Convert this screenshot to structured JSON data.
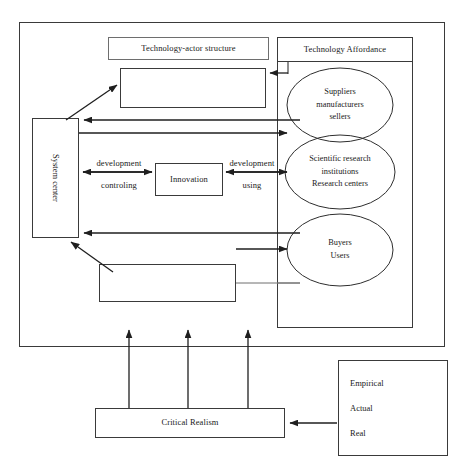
{
  "figure": {
    "type": "diagram",
    "title": ""
  },
  "outer_frame": {
    "name": "main-framework-border"
  },
  "nodes": {
    "technology_actor_structure_label": "Technology-actor structure",
    "technology_actor_structure_body": "",
    "technology_affordance_label": "Technology Affordance",
    "system_center": "System center",
    "innovation": "Innovation",
    "lower_structure_body": "",
    "critical_realism": "Critical Realism"
  },
  "affordance_groups": [
    {
      "id": "suppliers",
      "lines": [
        "Suppliers",
        "manufacturers",
        "sellers"
      ]
    },
    {
      "id": "research",
      "lines": [
        "Scientific research",
        "institutions",
        "Research centers"
      ]
    },
    {
      "id": "buyers",
      "lines": [
        "Buyers",
        "Users"
      ]
    }
  ],
  "edge_labels": {
    "left_top": "development",
    "left_bottom": "controling",
    "right_top": "development",
    "right_bottom": "using"
  },
  "critical_realism_strata": [
    "Empirical",
    "Actual",
    "Real"
  ],
  "colors": {
    "stroke": "#3a3a3a",
    "thin_stroke": "#6e6e6e",
    "text": "#1a1a1a",
    "background": "#ffffff",
    "bleed_through": "#ececec"
  }
}
